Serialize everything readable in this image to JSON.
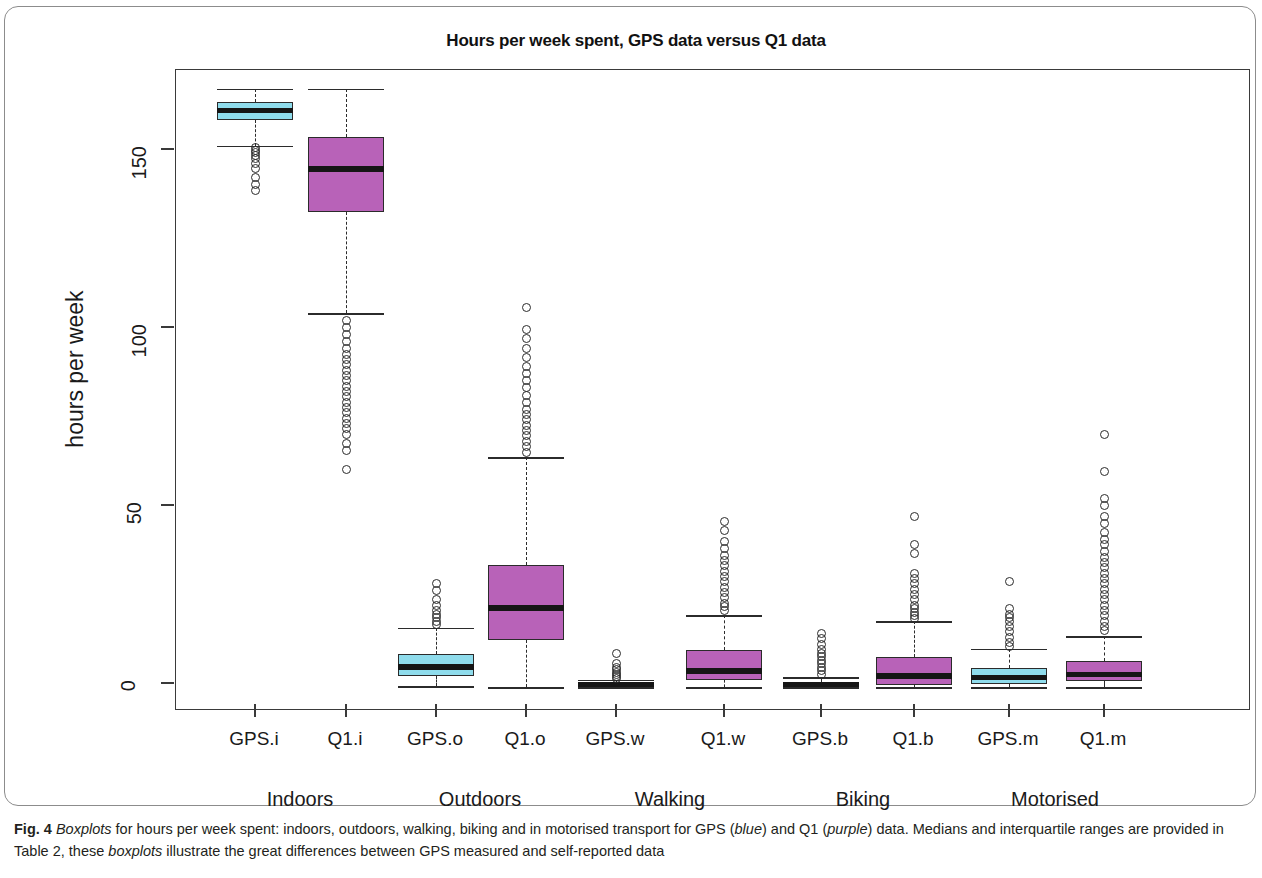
{
  "figure": {
    "title": "Hours per week spent, GPS data versus Q1 data",
    "caption_prefix": "Fig. 4",
    "caption_parts": [
      {
        "text": "Boxplots",
        "style": "italic"
      },
      {
        "text": " for hours per week spent: indoors, outdoors, walking, biking and in motorised transport for GPS (",
        "style": "normal"
      },
      {
        "text": "blue",
        "style": "italic"
      },
      {
        "text": ") and Q1 (",
        "style": "normal"
      },
      {
        "text": "purple",
        "style": "italic"
      },
      {
        "text": ") data. Medians and interquartile ranges are provided in Table 2, these ",
        "style": "normal"
      },
      {
        "text": "boxplots",
        "style": "italic"
      },
      {
        "text": " illustrate the great differences between GPS measured and self-reported data",
        "style": "normal"
      }
    ],
    "caption_plain": "Fig. 4 Boxplots for hours per week spent: indoors, outdoors, walking, biking and in motorised transport for GPS (blue) and Q1 (purple) data. Medians and interquartile ranges are provided in Table 2, these boxplots illustrate the great differences between GPS measured and self-reported data"
  },
  "colors": {
    "gps_blue": "#8fdcec",
    "q1_purple": "#b862b8",
    "stroke": "#2b2b2b",
    "frame": "#3a3a3a"
  },
  "chart_data": {
    "type": "box",
    "title": "Hours per week spent, GPS data versus Q1 data",
    "xlabel": "",
    "ylabel": "hours per week",
    "ylim": [
      -4,
      175
    ],
    "yticks": [
      0,
      50,
      100,
      150
    ],
    "ytick_labels": [
      "0",
      "50",
      "100",
      "150"
    ],
    "grid": false,
    "legend": "none",
    "group_labels": [
      "Indoors",
      "Outdoors",
      "Walking",
      "Biking",
      "Motorised"
    ],
    "categories": [
      "GPS.i",
      "Q1.i",
      "GPS.o",
      "Q1.o",
      "GPS.w",
      "Q1.w",
      "GPS.b",
      "Q1.b",
      "GPS.m",
      "Q1.m"
    ],
    "boxes": [
      {
        "label": "GPS.i",
        "series": "GPS",
        "color": "#8fdcec",
        "whisker_low": 152.0,
        "q1": 159.3,
        "median": 162.0,
        "q3": 164.2,
        "whisker_high": 168.0,
        "outliers": [
          151.5,
          150.8,
          150.0,
          149.2,
          148.5,
          147.0,
          145.5,
          143.0,
          141.0,
          139.5
        ]
      },
      {
        "label": "Q1.i",
        "series": "Q1",
        "color": "#b862b8",
        "whisker_low": 105.0,
        "q1": 133.5,
        "median": 145.5,
        "q3": 154.5,
        "whisker_high": 168.0,
        "outliers": [
          103.0,
          101.0,
          99.0,
          97.0,
          95.0,
          93.5,
          92.0,
          90.5,
          89.0,
          87.5,
          86.0,
          84.5,
          83.0,
          81.5,
          80.0,
          78.5,
          77.0,
          75.5,
          74.0,
          72.5,
          71.0,
          68.5,
          66.5,
          61.0
        ]
      },
      {
        "label": "GPS.o",
        "series": "GPS",
        "color": "#8fdcec",
        "whisker_low": 0.3,
        "q1": 3.2,
        "median": 5.6,
        "q3": 9.3,
        "whisker_high": 16.6,
        "outliers": [
          29.0,
          27.0,
          24.5,
          23.0,
          21.5,
          20.5,
          19.5,
          18.5,
          17.5
        ]
      },
      {
        "label": "Q1.o",
        "series": "Q1",
        "color": "#b862b8",
        "whisker_low": 0.0,
        "q1": 13.2,
        "median": 22.2,
        "q3": 34.3,
        "whisker_high": 64.5,
        "outliers": [
          106.5,
          100.5,
          98.0,
          95.0,
          92.5,
          90.0,
          88.0,
          86.0,
          84.0,
          82.0,
          80.0,
          78.0,
          76.5,
          75.0,
          73.5,
          72.0,
          70.5,
          69.0,
          67.5,
          66.0
        ]
      },
      {
        "label": "GPS.w",
        "series": "GPS",
        "color": "#8fdcec",
        "whisker_low": 0.0,
        "q1": 0.2,
        "median": 0.6,
        "q3": 1.1,
        "whisker_high": 2.0,
        "outliers": [
          9.5,
          6.5,
          5.5,
          4.8,
          4.2,
          3.6,
          3.0,
          2.5
        ]
      },
      {
        "label": "Q1.w",
        "series": "Q1",
        "color": "#b862b8",
        "whisker_low": 0.0,
        "q1": 2.0,
        "median": 4.5,
        "q3": 10.4,
        "whisker_high": 20.2,
        "outliers": [
          46.5,
          44.0,
          41.0,
          39.0,
          37.0,
          35.5,
          34.0,
          32.5,
          31.0,
          29.5,
          28.0,
          26.5,
          25.0,
          23.5,
          22.5,
          21.5
        ]
      },
      {
        "label": "GPS.b",
        "series": "GPS",
        "color": "#8fdcec",
        "whisker_low": 0.0,
        "q1": 0.2,
        "median": 0.7,
        "q3": 1.4,
        "whisker_high": 2.8,
        "outliers": [
          15.0,
          13.5,
          12.0,
          10.5,
          9.5,
          8.5,
          7.5,
          6.5,
          5.5,
          4.5,
          3.6
        ]
      },
      {
        "label": "Q1.b",
        "series": "Q1",
        "color": "#b862b8",
        "whisker_low": 0.0,
        "q1": 0.6,
        "median": 3.1,
        "q3": 8.4,
        "whisker_high": 18.5,
        "outliers": [
          48.0,
          40.0,
          37.5,
          32.0,
          30.5,
          29.0,
          27.5,
          26.0,
          24.5,
          23.0,
          22.0,
          21.0,
          20.0,
          19.3
        ]
      },
      {
        "label": "GPS.m",
        "series": "GPS",
        "color": "#8fdcec",
        "whisker_low": 0.0,
        "q1": 0.8,
        "median": 2.6,
        "q3": 5.3,
        "whisker_high": 10.8,
        "outliers": [
          29.5,
          22.0,
          20.5,
          19.5,
          18.5,
          17.0,
          15.5,
          14.0,
          12.5,
          11.5
        ]
      },
      {
        "label": "Q1.m",
        "series": "Q1",
        "color": "#b862b8",
        "whisker_low": 0.0,
        "q1": 1.7,
        "median": 3.4,
        "q3": 7.2,
        "whisker_high": 14.2,
        "outliers": [
          70.8,
          60.5,
          53.0,
          51.0,
          48.0,
          46.0,
          43.5,
          41.5,
          40.0,
          38.0,
          36.5,
          35.0,
          33.5,
          32.0,
          30.5,
          29.0,
          27.5,
          26.0,
          24.5,
          23.0,
          21.5,
          20.0,
          18.5,
          17.0,
          15.8
        ]
      }
    ]
  }
}
